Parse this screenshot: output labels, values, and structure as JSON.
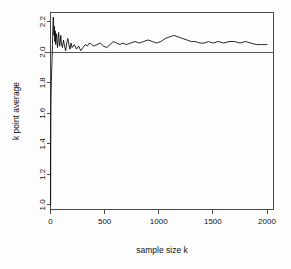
{
  "chart_data": {
    "type": "line",
    "title": "",
    "xlabel": "sample size k",
    "ylabel": "k point average",
    "xlim": [
      0,
      2060
    ],
    "ylim": [
      0.97,
      2.26
    ],
    "xticks": [
      0,
      500,
      1000,
      1500,
      2000
    ],
    "xtick_labels": [
      "0",
      "500",
      "1000",
      "1500",
      "2000"
    ],
    "yticks": [
      1.0,
      1.2,
      1.4,
      1.6,
      1.8,
      2.0,
      2.2
    ],
    "ytick_labels": [
      "1.0",
      "1.2",
      "1.4",
      "1.6",
      "1.8",
      "2.0",
      "2.2"
    ],
    "grid": false,
    "legend": null,
    "annotations": [
      {
        "name": "reference-line",
        "type": "hline",
        "y": 2.0,
        "label": "true mean = 2.0"
      }
    ],
    "series": [
      {
        "name": "k point average",
        "color": "#000000",
        "x": [
          1,
          2,
          3,
          4,
          5,
          6,
          7,
          8,
          9,
          10,
          12,
          14,
          16,
          18,
          20,
          22,
          24,
          26,
          28,
          30,
          32,
          34,
          36,
          38,
          40,
          42,
          44,
          46,
          48,
          50,
          55,
          60,
          65,
          70,
          75,
          80,
          85,
          90,
          95,
          100,
          110,
          120,
          130,
          140,
          150,
          160,
          170,
          180,
          190,
          200,
          220,
          240,
          260,
          280,
          300,
          320,
          340,
          360,
          380,
          400,
          430,
          460,
          490,
          520,
          550,
          580,
          610,
          640,
          670,
          700,
          740,
          780,
          820,
          860,
          900,
          940,
          980,
          1020,
          1060,
          1100,
          1140,
          1180,
          1220,
          1260,
          1300,
          1340,
          1380,
          1420,
          1460,
          1500,
          1550,
          1600,
          1650,
          1700,
          1750,
          1800,
          1850,
          1900,
          1950,
          2000
        ],
        "y": [
          1.0,
          1.34,
          1.52,
          1.63,
          1.7,
          1.74,
          1.78,
          1.81,
          1.84,
          1.86,
          1.9,
          1.94,
          1.99,
          2.05,
          2.11,
          2.16,
          2.2,
          2.23,
          2.2,
          2.16,
          2.11,
          2.13,
          2.17,
          2.12,
          2.07,
          2.1,
          2.14,
          2.09,
          2.05,
          2.08,
          2.12,
          2.07,
          2.03,
          2.09,
          2.13,
          2.08,
          2.04,
          2.07,
          2.11,
          2.06,
          2.03,
          2.08,
          2.04,
          2.01,
          2.06,
          2.09,
          2.05,
          2.02,
          2.06,
          2.03,
          2.05,
          2.02,
          2.04,
          2.01,
          2.03,
          2.05,
          2.04,
          2.06,
          2.05,
          2.04,
          2.05,
          2.06,
          2.04,
          2.03,
          2.05,
          2.07,
          2.06,
          2.05,
          2.06,
          2.05,
          2.06,
          2.07,
          2.06,
          2.07,
          2.08,
          2.07,
          2.06,
          2.07,
          2.09,
          2.1,
          2.11,
          2.1,
          2.09,
          2.08,
          2.07,
          2.07,
          2.06,
          2.06,
          2.07,
          2.06,
          2.07,
          2.06,
          2.07,
          2.07,
          2.06,
          2.07,
          2.06,
          2.05,
          2.05,
          2.05
        ]
      }
    ]
  }
}
